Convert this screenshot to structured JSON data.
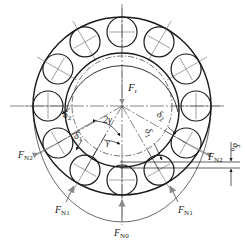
{
  "diagram": {
    "type": "rolling bearing radial load distribution",
    "colors": {
      "line": "#1a1a1a",
      "thin": "#444444",
      "arrow": "#8a8a8a",
      "background": "#ffffff"
    },
    "geometry": {
      "center": [
        122,
        106
      ],
      "outer_ring_radius": 89,
      "inner_ring_radius": 57,
      "inner_ring_shifted_center": [
        122,
        110
      ],
      "inner_dashed_radius": 50,
      "pitch_radius": 74,
      "ball_radius": 15,
      "ball_count": 12,
      "envelope": {
        "rx": 89,
        "ry": 116
      }
    },
    "labels": {
      "Fr": {
        "main": "F",
        "sub": "r"
      },
      "FN0": {
        "main": "F",
        "sub": "N0"
      },
      "FN1_left": {
        "main": "F",
        "sub": "N1"
      },
      "FN1_right": {
        "main": "F",
        "sub": "N1"
      },
      "FN2_left": {
        "main": "F",
        "sub": "N2"
      },
      "FN2_right": {
        "main": "F",
        "sub": "N2"
      },
      "delta2_left": {
        "main": "δ",
        "sub": "2"
      },
      "delta1_left": {
        "main": "δ",
        "sub": "1"
      },
      "delta2_right": {
        "main": "δ",
        "sub": "2"
      },
      "delta1_right": {
        "main": "δ",
        "sub": "1"
      },
      "delta0": {
        "main": "δ",
        "sub": "0"
      },
      "two_gamma": "2γ",
      "gamma": "γ"
    }
  }
}
